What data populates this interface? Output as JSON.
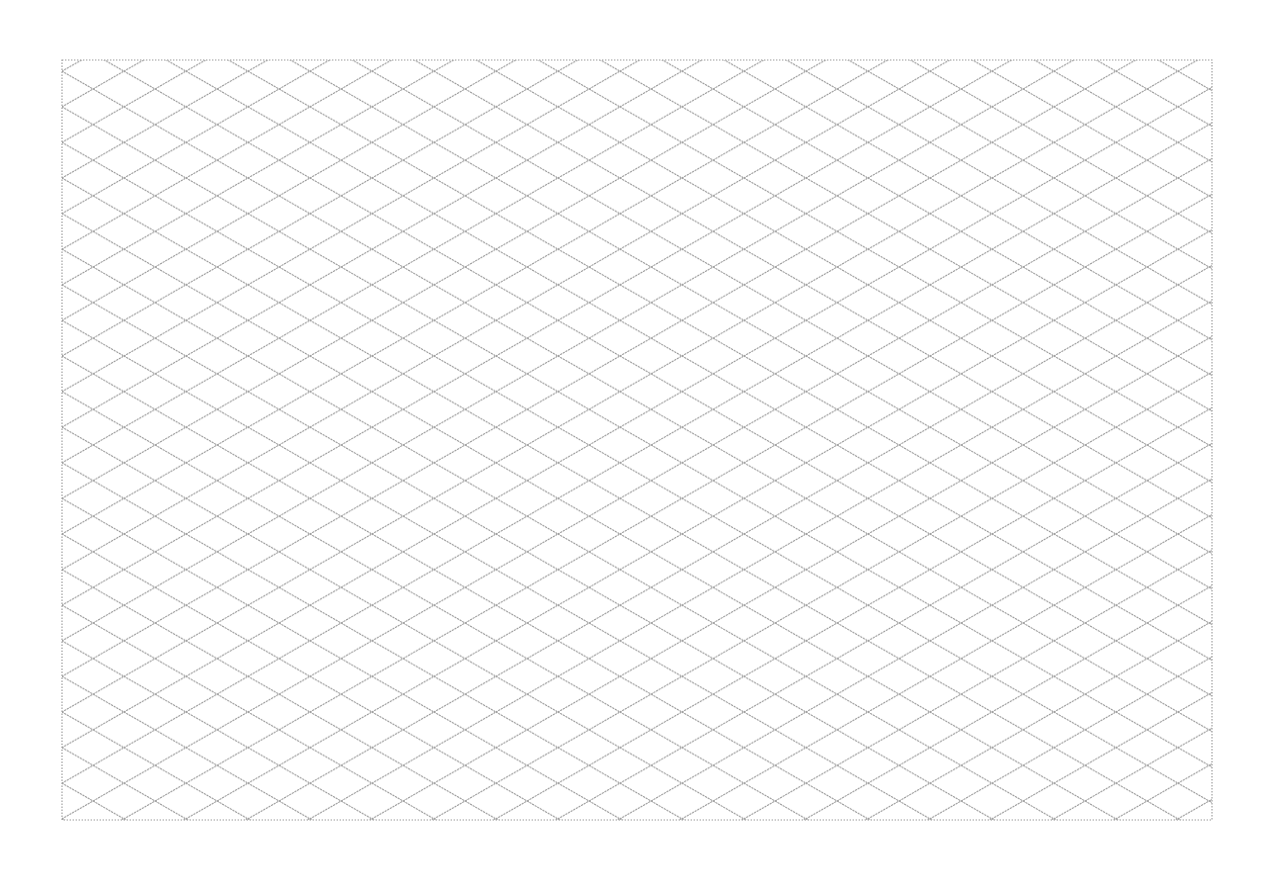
{
  "page": {
    "kind": "isometric-grid-paper",
    "background_color": "#ffffff"
  },
  "grid": {
    "border": {
      "x": 62,
      "y": 60,
      "width": 1150,
      "height": 760
    },
    "cell_width": 62,
    "cell_height": 35.6,
    "origin_x": 62,
    "origin_y": 71.2,
    "line_angle_degrees": 30,
    "line_color": "#9a9a9a",
    "line_style": "dotted"
  }
}
